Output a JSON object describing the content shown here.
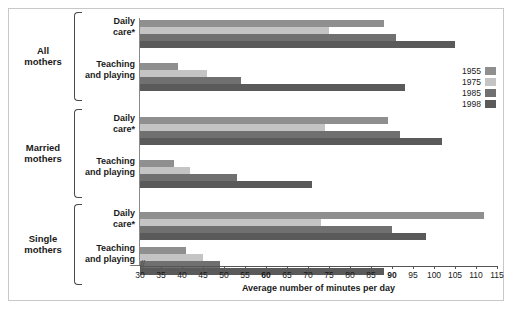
{
  "chart_data": {
    "type": "bar",
    "orientation": "horizontal",
    "title": "",
    "xlabel": "Average number of minutes per day",
    "ylabel": "",
    "xlim": [
      30,
      115
    ],
    "xticks": [
      30,
      35,
      40,
      45,
      50,
      55,
      60,
      65,
      70,
      75,
      80,
      85,
      90,
      95,
      100,
      105,
      110,
      115
    ],
    "bold_xticks": [
      60,
      90
    ],
    "axis_break": true,
    "axis_break_glyph": "–//",
    "grid": false,
    "legend_position": "right",
    "series": [
      {
        "name": "1955",
        "color": "#8f8f8f",
        "values": [
          88,
          39,
          89,
          38,
          112,
          41
        ]
      },
      {
        "name": "1975",
        "color": "#c4c4c4",
        "values": [
          75,
          46,
          74,
          42,
          73,
          45
        ]
      },
      {
        "name": "1985",
        "color": "#707070",
        "values": [
          91,
          54,
          92,
          53,
          90,
          49
        ]
      },
      {
        "name": "1998",
        "color": "#5a5a5a",
        "values": [
          105,
          93,
          102,
          71,
          98,
          88
        ]
      }
    ],
    "categories": [
      "All mothers – Daily care*",
      "All mothers – Teaching and playing",
      "Married mothers – Daily care*",
      "Married mothers – Teaching and playing",
      "Single mothers – Daily care*",
      "Single mothers – Teaching and playing"
    ],
    "groups": [
      {
        "label_line1": "All",
        "label_line2": "mothers",
        "rows": [
          {
            "label_line1": "Daily",
            "label_line2": "care*"
          },
          {
            "label_line1": "Teaching",
            "label_line2": "and playing"
          }
        ]
      },
      {
        "label_line1": "Married",
        "label_line2": "mothers",
        "rows": [
          {
            "label_line1": "Daily",
            "label_line2": "care*"
          },
          {
            "label_line1": "Teaching",
            "label_line2": "and playing"
          }
        ]
      },
      {
        "label_line1": "Single",
        "label_line2": "mothers",
        "rows": [
          {
            "label_line1": "Daily",
            "label_line2": "care*"
          },
          {
            "label_line1": "Teaching",
            "label_line2": "and playing"
          }
        ]
      }
    ]
  },
  "legend": {
    "items": [
      {
        "label": "1955",
        "color": "#8f8f8f"
      },
      {
        "label": "1975",
        "color": "#c4c4c4"
      },
      {
        "label": "1985",
        "color": "#707070"
      },
      {
        "label": "1998",
        "color": "#5a5a5a"
      }
    ]
  },
  "axis": {
    "x_title": "Average number of minutes per day"
  }
}
